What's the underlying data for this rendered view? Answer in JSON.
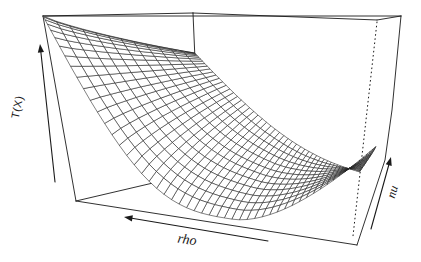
{
  "figure": {
    "background": "#ffffff",
    "line_color": "#1a1a1a",
    "mesh_fill": "#ffffff"
  },
  "chart_data": {
    "type": "surface",
    "title": "",
    "axis_labels": {
      "z": "T(X)",
      "x": "rho",
      "y": "nu"
    },
    "legend": null,
    "tick_labels": [],
    "grid": {
      "rho_lines": 57,
      "nu_lines": 13
    },
    "layout_hints": {
      "projection": "hand-drawn perspective box",
      "hidden_edge_style": "dotted",
      "axes_drawn_as": "arrows outside box",
      "z_range_normalized": [
        0,
        1
      ]
    },
    "surface_model": {
      "comment": "z(u,v): u=0 right..1 left (rho dir), v=0 near face..1 far face (nu dir)",
      "valley_u0": 0.44,
      "near_profile": {
        "base": 0.03,
        "left_amp": 0.97,
        "left_pow": 3.1,
        "right_amp": 0.4,
        "right_pow": 1.7
      },
      "far_profile": {
        "base": 0.3,
        "amp": 0.45,
        "pow": 2.4
      },
      "depth_blend_pow": 0.85
    }
  }
}
